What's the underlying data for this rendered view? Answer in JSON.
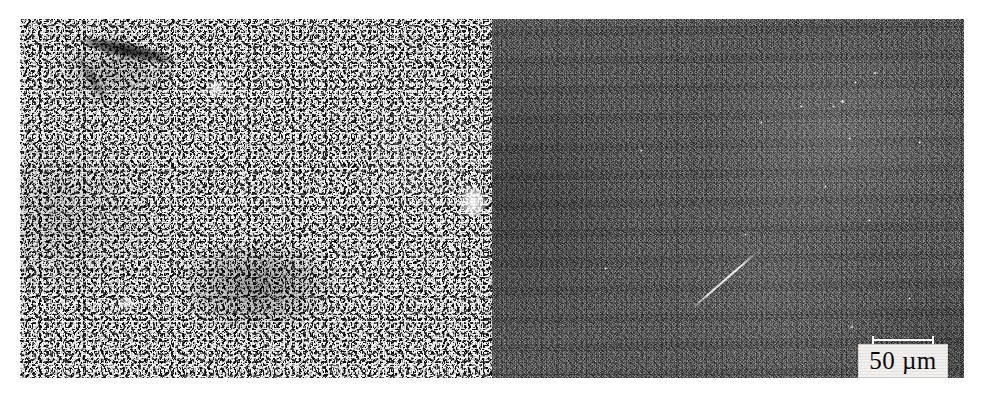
{
  "figure": {
    "type": "two-panel-micrograph",
    "panels": [
      {
        "id": "left",
        "name": "left-micrograph",
        "tone": "#8d8d8d",
        "texture": "coarse high-contrast speckle",
        "features": [
          {
            "name": "dark-elongated-defect",
            "position": "upper-left"
          },
          {
            "name": "dark-blotch",
            "position": "lower-center"
          },
          {
            "name": "bright-spot",
            "position": "right-edge-middle"
          }
        ]
      },
      {
        "id": "right",
        "name": "right-micrograph",
        "tone": "#3b3b3b",
        "texture": "fine low-contrast dark grain",
        "features": [
          {
            "name": "bright-diagonal-scratch",
            "position": "lower-center"
          },
          {
            "name": "bright-particles",
            "position": "upper-right"
          },
          {
            "name": "bright-region",
            "position": "upper-center-right"
          }
        ]
      }
    ]
  },
  "scalebar": {
    "label": "50 µm",
    "value": "50",
    "unit": "µm",
    "bar_color": "#ffffff",
    "label_background": "#f2f0ee",
    "label_color": "#0a0a0a",
    "position": "bottom-right of right panel"
  },
  "particles": [
    {
      "left": 381,
      "top": 52,
      "size": 4
    },
    {
      "left": 362,
      "top": 62,
      "size": 3
    },
    {
      "left": 348,
      "top": 80,
      "size": 5
    },
    {
      "left": 340,
      "top": 86,
      "size": 3
    },
    {
      "left": 308,
      "top": 86,
      "size": 3
    },
    {
      "left": 268,
      "top": 102,
      "size": 3
    },
    {
      "left": 356,
      "top": 118,
      "size": 3
    },
    {
      "left": 148,
      "top": 130,
      "size": 3
    },
    {
      "left": 426,
      "top": 122,
      "size": 3
    },
    {
      "left": 332,
      "top": 166,
      "size": 3
    },
    {
      "left": 376,
      "top": 200,
      "size": 3
    },
    {
      "left": 252,
      "top": 214,
      "size": 3
    },
    {
      "left": 358,
      "top": 306,
      "size": 4
    },
    {
      "left": 416,
      "top": 278,
      "size": 3
    },
    {
      "left": 112,
      "top": 248,
      "size": 3
    }
  ]
}
